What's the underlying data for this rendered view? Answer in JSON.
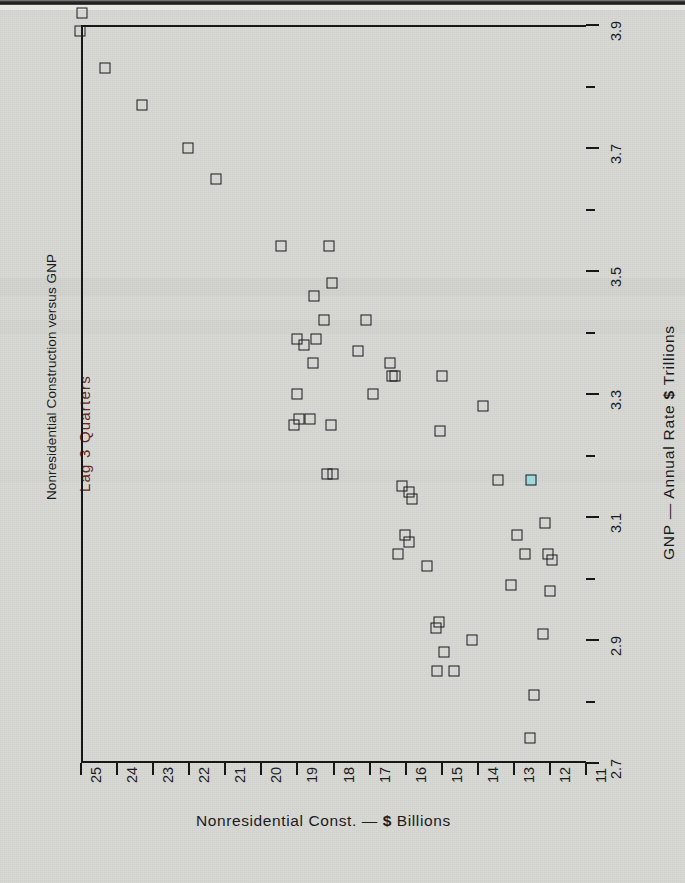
{
  "page": {
    "background_color": "#d7d7d3",
    "ink_color": "#1b1b1e",
    "accent_color": "#6a2525",
    "highlight_color": "#9fd9dd"
  },
  "chart_data": {
    "type": "scatter",
    "title": "Nonresidential Construction versus GNP",
    "subtitle": "Lag 3 Quarters",
    "orientation": "rotated-90",
    "xlabel": "GNP — Annual Rate $ Trillions",
    "ylabel": "Nonresidential Const. — $ Billions",
    "xlim": [
      2.7,
      3.9
    ],
    "ylim": [
      11,
      25
    ],
    "x_ticks": [
      2.7,
      2.9,
      3.1,
      3.3,
      3.5,
      3.7,
      3.9
    ],
    "x_tick_labels": [
      "2.7",
      "2.9",
      "3.1",
      "3.3",
      "3.5",
      "3.7",
      "3.9"
    ],
    "x_minor_ticks": [
      2.8,
      3.0,
      3.2,
      3.4,
      3.6,
      3.8
    ],
    "y_ticks": [
      25,
      24,
      23,
      22,
      21,
      20,
      19,
      18,
      17,
      16,
      15,
      14,
      13,
      12,
      11
    ],
    "y_tick_labels": [
      "25",
      "24",
      "23",
      "22",
      "21",
      "20",
      "19",
      "18",
      "17",
      "16",
      "15",
      "14",
      "13",
      "12",
      "11"
    ],
    "grid": false,
    "legend": null,
    "marker_style": "open-square",
    "points": [
      {
        "gnp": 3.92,
        "const": 24.97
      },
      {
        "gnp": 3.89,
        "const": 25.02
      },
      {
        "gnp": 3.83,
        "const": 24.33
      },
      {
        "gnp": 3.77,
        "const": 23.3
      },
      {
        "gnp": 3.7,
        "const": 22.03
      },
      {
        "gnp": 3.65,
        "const": 21.25
      },
      {
        "gnp": 3.54,
        "const": 19.45
      },
      {
        "gnp": 3.54,
        "const": 18.12
      },
      {
        "gnp": 3.48,
        "const": 18.05
      },
      {
        "gnp": 3.46,
        "const": 18.55
      },
      {
        "gnp": 3.42,
        "const": 18.25
      },
      {
        "gnp": 3.42,
        "const": 17.1
      },
      {
        "gnp": 3.39,
        "const": 19.0
      },
      {
        "gnp": 3.39,
        "const": 18.48
      },
      {
        "gnp": 3.38,
        "const": 18.82
      },
      {
        "gnp": 3.37,
        "const": 17.33
      },
      {
        "gnp": 3.35,
        "const": 18.58
      },
      {
        "gnp": 3.35,
        "const": 16.43
      },
      {
        "gnp": 3.33,
        "const": 16.38
      },
      {
        "gnp": 3.33,
        "const": 16.3
      },
      {
        "gnp": 3.33,
        "const": 15.0
      },
      {
        "gnp": 3.3,
        "const": 19.0
      },
      {
        "gnp": 3.3,
        "const": 16.9
      },
      {
        "gnp": 3.28,
        "const": 13.85
      },
      {
        "gnp": 3.26,
        "const": 18.65
      },
      {
        "gnp": 3.26,
        "const": 18.95
      },
      {
        "gnp": 3.25,
        "const": 19.1
      },
      {
        "gnp": 3.25,
        "const": 18.08
      },
      {
        "gnp": 3.24,
        "const": 15.05
      },
      {
        "gnp": 3.17,
        "const": 18.18
      },
      {
        "gnp": 3.17,
        "const": 18.02
      },
      {
        "gnp": 3.16,
        "const": 13.45
      },
      {
        "gnp": 3.16,
        "const": 12.52
      },
      {
        "gnp": 3.15,
        "const": 16.1
      },
      {
        "gnp": 3.14,
        "const": 15.92
      },
      {
        "gnp": 3.13,
        "const": 15.82
      },
      {
        "gnp": 3.09,
        "const": 12.15
      },
      {
        "gnp": 3.07,
        "const": 16.02
      },
      {
        "gnp": 3.07,
        "const": 12.9
      },
      {
        "gnp": 3.06,
        "const": 15.9
      },
      {
        "gnp": 3.04,
        "const": 16.22
      },
      {
        "gnp": 3.04,
        "const": 12.68
      },
      {
        "gnp": 3.04,
        "const": 12.05
      },
      {
        "gnp": 3.03,
        "const": 11.95
      },
      {
        "gnp": 3.02,
        "const": 15.42
      },
      {
        "gnp": 2.99,
        "const": 13.08
      },
      {
        "gnp": 2.98,
        "const": 12.0
      },
      {
        "gnp": 2.93,
        "const": 15.08
      },
      {
        "gnp": 2.92,
        "const": 15.15
      },
      {
        "gnp": 2.91,
        "const": 12.18
      },
      {
        "gnp": 2.9,
        "const": 14.15
      },
      {
        "gnp": 2.88,
        "const": 14.95
      },
      {
        "gnp": 2.85,
        "const": 15.12
      },
      {
        "gnp": 2.85,
        "const": 14.65
      },
      {
        "gnp": 2.81,
        "const": 12.45
      },
      {
        "gnp": 2.74,
        "const": 12.55
      }
    ],
    "highlighted_point": {
      "gnp": 3.16,
      "const": 12.52,
      "color": "#9fd9dd"
    }
  }
}
